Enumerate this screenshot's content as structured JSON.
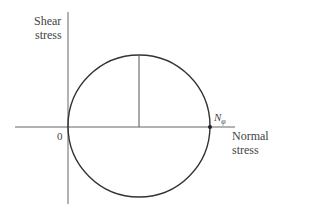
{
  "diagram": {
    "type": "mohr-circle",
    "y_axis_label_line1": "Shear",
    "y_axis_label_line2": "stress",
    "x_axis_label_line1": "Normal",
    "x_axis_label_line2": "stress",
    "origin_label": "0",
    "point_label": "N",
    "point_label_subscript": "φ",
    "colors": {
      "line": "#333333",
      "axis": "#555555",
      "text": "#444444"
    }
  }
}
